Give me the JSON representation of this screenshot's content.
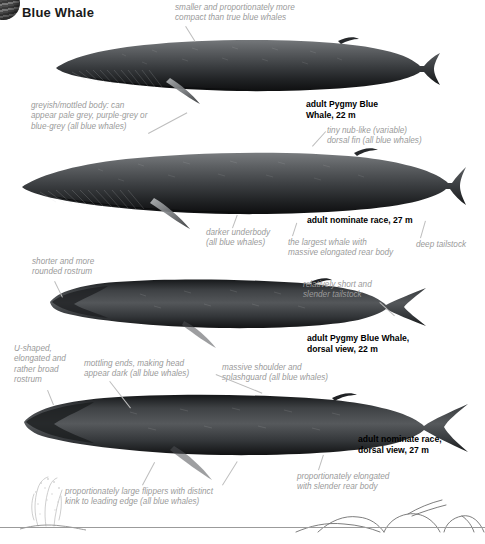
{
  "header": {
    "title": "Blue Whale",
    "corner_icon": "sphere-icon"
  },
  "figure": {
    "type": "species-identification-plate",
    "species": "Blue Whale",
    "panels": [
      {
        "id": "panel-1",
        "view": "lateral",
        "label": "adult Pygmy Blue\nWhale, 22 m",
        "label_name": "adult Pygmy Blue Whale, 22 m",
        "length_m": 22,
        "race": "Pygmy Blue Whale"
      },
      {
        "id": "panel-2",
        "view": "lateral",
        "label": "adult nominate race, 27 m",
        "label_name": "adult nominate race, 27 m",
        "length_m": 27,
        "race": "nominate race"
      },
      {
        "id": "panel-3",
        "view": "dorsal",
        "label": "adult Pygmy Blue Whale,\ndorsal view, 22 m",
        "label_name": "adult Pygmy Blue Whale, dorsal view, 22 m",
        "length_m": 22,
        "race": "Pygmy Blue Whale"
      },
      {
        "id": "panel-4",
        "view": "dorsal",
        "label": "adult nominate race,\ndorsal view, 27 m",
        "label_name": "adult nominate race, dorsal view, 27 m",
        "length_m": 27,
        "race": "nominate race"
      }
    ],
    "annotations": [
      {
        "id": "ann-compact",
        "text": "smaller and proportionately more\ncompact than true blue whales"
      },
      {
        "id": "ann-mottled-body",
        "text": "greyish/mottled body: can\nappear pale grey, purple-grey or\nblue-grey (all blue whales)"
      },
      {
        "id": "ann-dorsal-fin",
        "text": "tiny nub-like (variable)\ndorsal fin (all blue whales)"
      },
      {
        "id": "ann-underbody",
        "text": "darker underbody\n(all blue whales)"
      },
      {
        "id": "ann-largest-whale",
        "text": "the largest whale with\nmassive elongated rear body"
      },
      {
        "id": "ann-deep-tailstock",
        "text": "deep tailstock"
      },
      {
        "id": "ann-short-rostrum",
        "text": "shorter and more\nrounded rostrum"
      },
      {
        "id": "ann-slender-tailstock",
        "text": "relatively short and\nslender tailstock"
      },
      {
        "id": "ann-u-shaped-rostrum",
        "text": "U-shaped,\nelongated and\nrather broad\nrostrum"
      },
      {
        "id": "ann-mottling-ends",
        "text": "mottling ends, making head\nappear dark (all blue whales)"
      },
      {
        "id": "ann-splashguard",
        "text": "massive shoulder and\nsplashguard (all blue whales)"
      },
      {
        "id": "ann-flippers",
        "text": "proportionately large flippers with distinct\nkink to leading edge (all blue whales)"
      },
      {
        "id": "ann-elongated-rear",
        "text": "proportionately elongated\nwith slender rear body"
      }
    ],
    "footer_scene": {
      "blow": "whale-blow-silhouette",
      "dive_sequence": "surfacing-dive-sequence-outline"
    }
  },
  "colors": {
    "background": "#ffffff",
    "annotation_text": "#9a9a9a",
    "label_text": "#000000",
    "leader_line": "#bdbdbd",
    "body_dark": "#17181a",
    "body_mid": "#3a3d40",
    "body_light": "#6f7275",
    "waterline": "#9b9b9b"
  }
}
